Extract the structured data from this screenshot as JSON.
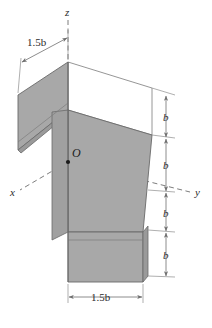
{
  "figure": {
    "background_color": "#ffffff",
    "face_fill_color": "#a8a8a8",
    "face_fill_color_dark": "#9a9a9a",
    "face_fill_color_light": "#ffffff",
    "outline_color": "#6a6a6a",
    "dimension_line_color": "#7d7d7d",
    "axis_line_color": "#7d7d7d",
    "text_color": "#2b2b2b"
  },
  "origin": {
    "label": "O",
    "x": 68,
    "y": 162
  },
  "axes": [
    {
      "name": "x-axis",
      "label": "x",
      "label_x": 13,
      "label_y": 196,
      "style": "dashed"
    },
    {
      "name": "y-axis",
      "label": "y",
      "label_x": 196,
      "label_y": 196,
      "style": "dashed"
    },
    {
      "name": "z-axis",
      "label": "z",
      "label_x": 68,
      "label_y": 13,
      "style": "dashed"
    }
  ],
  "dimensions": {
    "top_width": {
      "label": "1.5b",
      "value": "1.5",
      "symbol": "b",
      "x": 42,
      "y": 46
    },
    "bottom_width": {
      "label": "1.5b",
      "value": "1.5",
      "symbol": "b",
      "x": 104,
      "y": 302
    },
    "vertical_segments": [
      {
        "label": "b",
        "x": 166,
        "y": 120
      },
      {
        "label": "b",
        "x": 166,
        "y": 168
      },
      {
        "label": "b",
        "x": 166,
        "y": 216
      },
      {
        "label": "b",
        "x": 166,
        "y": 258
      }
    ]
  },
  "geometry": {
    "description": "Isometric Z-bent plate: upper-left shaded parallelogram panel, central inclined web panel, lower-right shaded parallelogram panel",
    "panels": [
      {
        "name": "upper-left-panel",
        "fill": "shaded"
      },
      {
        "name": "upper-back-panel",
        "fill": "white"
      },
      {
        "name": "central-web-panel",
        "fill": "shaded"
      },
      {
        "name": "lower-right-panel",
        "fill": "shaded"
      }
    ]
  }
}
